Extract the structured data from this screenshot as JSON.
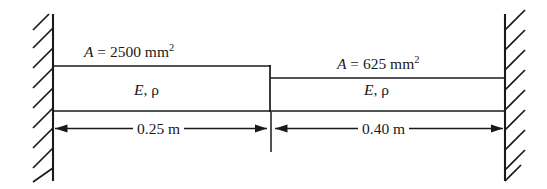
{
  "figure": {
    "type": "stepped-axial-bar-fixed-both-ends",
    "colors": {
      "line": "#1a1a1a",
      "text": "#1a1a1a",
      "background": "#ffffff"
    },
    "left_segment": {
      "area_label": "A = 2500 mm",
      "area_value": "2500",
      "area_unit": "mm",
      "area_exponent": "2",
      "area_symbol": "A",
      "material_label": "E, ρ",
      "modulus_symbol": "E",
      "density_symbol": "ρ",
      "length_label": "0.25 m",
      "length_value": "0.25",
      "length_unit": "m"
    },
    "right_segment": {
      "area_label": "A = 625 mm",
      "area_value": "625",
      "area_unit": "mm",
      "area_exponent": "2",
      "area_symbol": "A",
      "material_label": "E, ρ",
      "modulus_symbol": "E",
      "density_symbol": "ρ",
      "length_label": "0.40 m",
      "length_value": "0.40",
      "length_unit": "m"
    },
    "supports": {
      "left": "fixed-wall-hatched",
      "right": "fixed-wall-hatched"
    }
  }
}
